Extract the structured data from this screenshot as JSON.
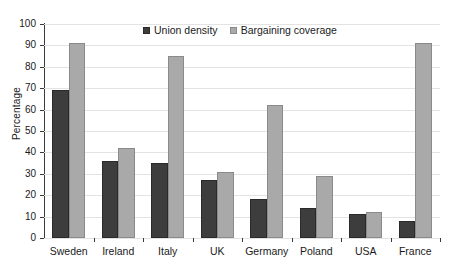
{
  "chart_data": {
    "type": "bar",
    "title": "",
    "subtitle": "",
    "xlabel": "",
    "ylabel": "Percentage",
    "ylim": [
      0,
      100
    ],
    "ytick_step": 10,
    "yticks": [
      0,
      10,
      20,
      30,
      40,
      50,
      60,
      70,
      80,
      90,
      100
    ],
    "grid": true,
    "legend_position": "top-center",
    "categories": [
      "Sweden",
      "Ireland",
      "Italy",
      "UK",
      "Germany",
      "Poland",
      "USA",
      "France"
    ],
    "series": [
      {
        "name": "Union density",
        "color": "#3d3d3d",
        "values": [
          69,
          36,
          35,
          27,
          18,
          14,
          11,
          8
        ]
      },
      {
        "name": "Bargaining coverage",
        "color": "#a9a9a9",
        "values": [
          91,
          42,
          85,
          31,
          62,
          29,
          12,
          91
        ]
      }
    ]
  }
}
